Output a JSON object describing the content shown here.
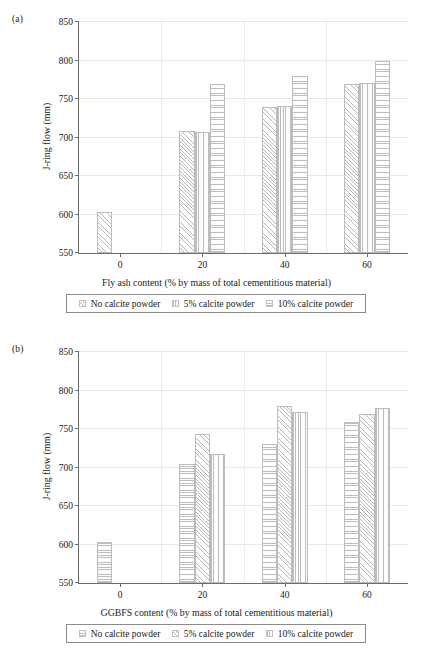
{
  "figure": {
    "width": 433,
    "height": 653,
    "background": "#ffffff",
    "grid_color": "#e8e8e8",
    "axis_color": "#6b6b6b",
    "bar_edge_color": "#bcbcbc"
  },
  "panels": [
    {
      "tag": "(a)",
      "chart_data": {
        "type": "bar",
        "title": "",
        "xlabel": "Fly ash content (% by mass of total cementitious material)",
        "ylabel": "J-ring flow (mm)",
        "categories": [
          "0",
          "20",
          "40",
          "60"
        ],
        "xticks": [
          "0",
          "20",
          "40",
          "60"
        ],
        "yticks": [
          550,
          600,
          650,
          700,
          750,
          800,
          850
        ],
        "ylim": [
          550,
          850
        ],
        "grid": true,
        "legend_position": "below",
        "series": [
          {
            "name": "No calcite powder",
            "pattern": "diagonal",
            "values": [
              603,
              708,
              740,
              769
            ]
          },
          {
            "name": "5% calcite powder",
            "pattern": "vertical",
            "values": [
              null,
              707,
              741,
              771
            ]
          },
          {
            "name": "10% calcite powder",
            "pattern": "horizontal",
            "values": [
              null,
              770,
              780,
              799
            ]
          }
        ]
      },
      "legend": [
        {
          "label": "No calcite powder",
          "pattern": "diagonal"
        },
        {
          "label": "5% calcite powder",
          "pattern": "vertical"
        },
        {
          "label": "10% calcite powder",
          "pattern": "horizontal"
        }
      ]
    },
    {
      "tag": "(b)",
      "chart_data": {
        "type": "bar",
        "title": "",
        "xlabel": "GGBFS content (% by mass of total cementitious material)",
        "ylabel": "J-ring flow (mm)",
        "categories": [
          "0",
          "20",
          "40",
          "60"
        ],
        "xticks": [
          "0",
          "20",
          "40",
          "60"
        ],
        "yticks": [
          550,
          600,
          650,
          700,
          750,
          800,
          850
        ],
        "ylim": [
          550,
          850
        ],
        "grid": true,
        "legend_position": "below",
        "series": [
          {
            "name": "No calcite powder",
            "pattern": "horizontal",
            "values": [
              603,
              704,
              730,
              759
            ]
          },
          {
            "name": "5% calcite powder",
            "pattern": "diagonal",
            "values": [
              null,
              743,
              780,
              769
            ]
          },
          {
            "name": "10% calcite powder",
            "pattern": "vertical",
            "values": [
              null,
              718,
              772,
              777
            ]
          }
        ]
      },
      "legend": [
        {
          "label": "No calcite powder",
          "pattern": "horizontal"
        },
        {
          "label": "5% calcite powder",
          "pattern": "diagonal"
        },
        {
          "label": "10% calcite powder",
          "pattern": "vertical"
        }
      ]
    }
  ]
}
